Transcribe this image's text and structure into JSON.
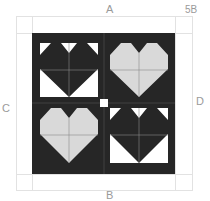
{
  "labels": {
    "top": "A",
    "bottom": "B",
    "left": "C",
    "right": "D",
    "corner": "5B"
  },
  "colors": {
    "dark": "#262626",
    "light_heart": "#d9d9d9",
    "white": "#ffffff",
    "guide": "#e2e2e2",
    "seam": "#8a8a8a",
    "label": "#9a9a9a"
  },
  "blocks": [
    {
      "position": "top-left",
      "heart": "dark",
      "background": "white"
    },
    {
      "position": "top-right",
      "heart": "light-gray",
      "background": "dark"
    },
    {
      "position": "bottom-left",
      "heart": "light-gray",
      "background": "dark"
    },
    {
      "position": "bottom-right",
      "heart": "dark",
      "background": "white"
    }
  ],
  "center_square": "white"
}
